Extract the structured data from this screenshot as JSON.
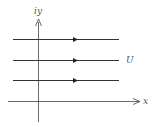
{
  "diagram": {
    "labels": {
      "y_axis": "iy",
      "x_axis": "x",
      "flow": "U"
    },
    "streamline_count": 3,
    "colors": {
      "line": "#333333",
      "label": "#555555"
    }
  }
}
